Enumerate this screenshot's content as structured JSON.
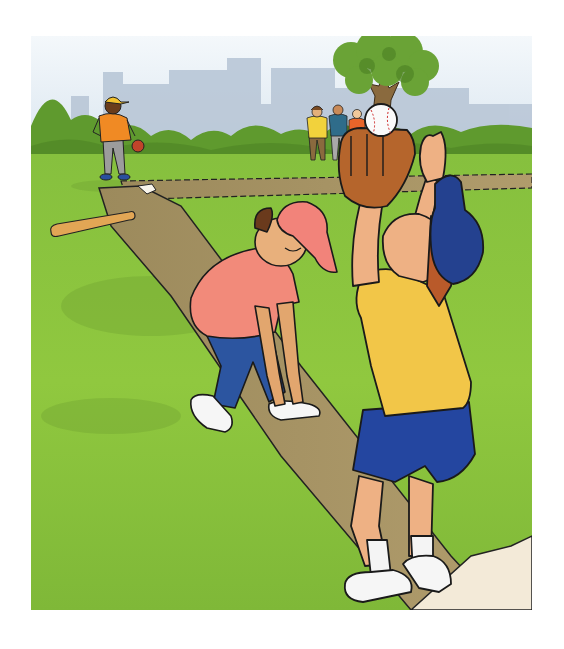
{
  "illustration": {
    "alt": "Cartoon of children playing baseball in a park",
    "colors": {
      "sky": "#dfeaf3",
      "skyline": "#b8c6d6",
      "bushes": "#5f9a30",
      "grass": "#8cc63f",
      "dirt": "#a89466",
      "base": "#f6efe0",
      "outline": "#1a1a1a"
    },
    "figures": [
      {
        "role": "batter-in-distance",
        "shirt": "#f08a24",
        "pants": "#9a9a9a",
        "cap": "#f2c12e"
      },
      {
        "role": "spectator-1",
        "shirt": "#f2d23c"
      },
      {
        "role": "spectator-2",
        "shirt": "#2f6c8a"
      },
      {
        "role": "spectator-3",
        "shirt": "#e8652a"
      },
      {
        "role": "boy-tying-shoe",
        "shirt": "#f08a7a",
        "pants": "#2c55a0",
        "cap": "#f08a7a"
      },
      {
        "role": "catcher",
        "shirt": "#f2c648",
        "shorts": "#2446a0",
        "cap": "#24418f"
      }
    ],
    "objects": [
      "baseball-bat",
      "home-plate",
      "baseball",
      "catchers-mitt",
      "tree"
    ]
  }
}
